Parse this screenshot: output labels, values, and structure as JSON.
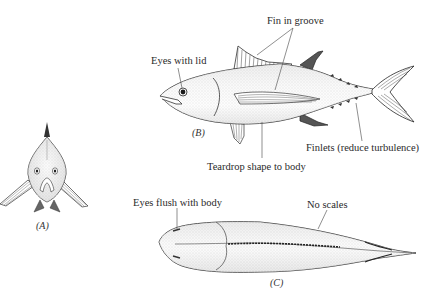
{
  "figure": {
    "views": [
      {
        "id": "A",
        "label": "(A)",
        "description": "front view"
      },
      {
        "id": "B",
        "label": "(B)",
        "description": "side view"
      },
      {
        "id": "C",
        "label": "(C)",
        "description": "top view"
      }
    ],
    "annotations": {
      "eyes_with_lid": "Eyes with lid",
      "fin_in_groove": "Fin in groove",
      "finlets": "Finlets (reduce turbulence)",
      "teardrop": "Teardrop shape to body",
      "eyes_flush": "Eyes flush with body",
      "no_scales": "No scales"
    },
    "colors": {
      "ink": "#2a2a2a",
      "stipple": "#bdbdbd",
      "background": "#ffffff"
    }
  }
}
